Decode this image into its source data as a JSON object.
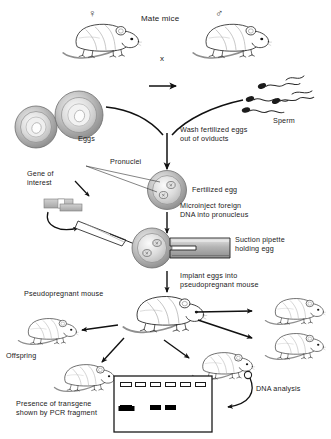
{
  "figure": {
    "background_color": "#ffffff",
    "ink_color": "#1a1a1a",
    "cell_fill_color": "#9a9a9a",
    "cell_highlight_color": "#d8d8d8"
  },
  "symbols": {
    "female": "♀",
    "male": "♂",
    "cross": "x"
  },
  "labels": {
    "mate_mice": "Mate mice",
    "sperm": "Sperm",
    "eggs": "Eggs",
    "wash_eggs": "Wash fertilized eggs\nout of oviducts",
    "pronuclei": "Pronuclei",
    "fertilized_egg": "Fertilized egg",
    "gene_of_interest": "Gene of\ninterest",
    "microinject": "Microinject foreign\nDNA into pronucleus",
    "suction_pipette": "Suction pipette\nholding egg",
    "implant_eggs": "Implant eggs into\npseudopregnant mouse",
    "pseudopregnant_mouse": "Pseudopregnant mouse",
    "offspring": "Offspring",
    "dna_analysis": "DNA analysis",
    "pcr_result": "Presence of transgene\nshown by PCR fragment"
  },
  "gel": {
    "lane_count": 6,
    "wells": [
      true,
      true,
      true,
      true,
      true,
      true
    ],
    "bands": [
      true,
      false,
      true,
      true,
      false,
      false
    ],
    "band_color": "#000000",
    "well_color": "#ffffff",
    "border_color": "#1a1a1a"
  },
  "offspring_mice": {
    "count": 4,
    "positions": [
      "left",
      "lower-left",
      "lower-center",
      "right-upper",
      "right-lower"
    ]
  }
}
